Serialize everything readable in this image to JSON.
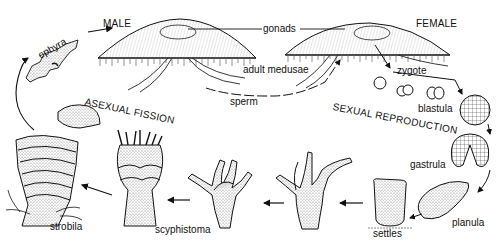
{
  "diagram": {
    "colors": {
      "ink": "#111111",
      "stipple": "#9a9a9a",
      "background": "#ffffff"
    },
    "labels": {
      "male": "MALE",
      "female": "FEMALE",
      "gonads": "gonads",
      "adult_medusae": "adult medusae",
      "sperm": "sperm",
      "zygote": "zygote",
      "blastula": "blastula",
      "gastrula": "gastrula",
      "planula": "planula",
      "settles": "settles",
      "scyphistoma": "scyphistoma",
      "strobila": "strobila",
      "ephyra": "ephyra",
      "asexual_fission": "ASEXUAL FISSION",
      "sexual_reproduction": "SEXUAL REPRODUCTION"
    },
    "stages": [
      "adult medusae (male & female)",
      "sperm",
      "zygote",
      "blastula",
      "gastrula",
      "planula",
      "settles",
      "scyphistoma",
      "strobila",
      "ephyra"
    ],
    "icons": [
      "male-medusa-icon",
      "female-medusa-icon",
      "zygote-cell-icon",
      "two-cell-stage-icon",
      "four-cell-stage-icon",
      "blastula-icon",
      "gastrula-icon",
      "planula-icon",
      "settled-larva-icon",
      "polyp-icon",
      "polyp-tentacled-icon",
      "scyphistoma-icon",
      "strobila-icon",
      "ephyra-icon",
      "released-ephyra-icon",
      "arrow-icon"
    ]
  }
}
